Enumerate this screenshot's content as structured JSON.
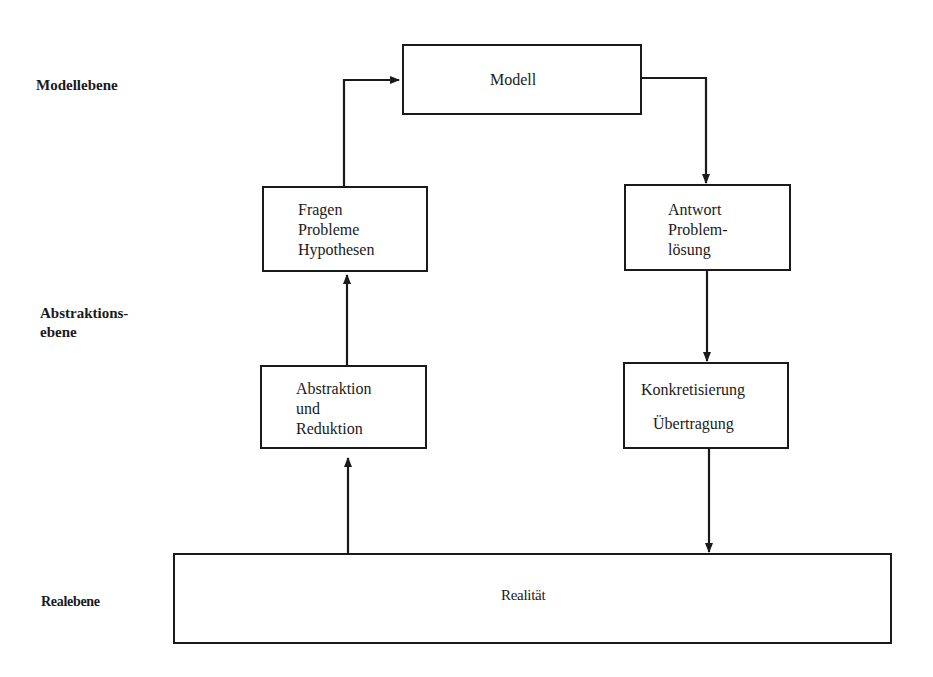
{
  "levels": {
    "model": "Modellebene",
    "abstraction_line1": "Abstraktions-",
    "abstraction_line2": "ebene",
    "real": "Realebene"
  },
  "boxes": {
    "modell": {
      "lines": [
        "Modell"
      ]
    },
    "fragen": {
      "lines": [
        "Fragen",
        "Probleme",
        "Hypothesen"
      ]
    },
    "antwort": {
      "lines": [
        "Antwort",
        "Problem-",
        "lösung"
      ]
    },
    "abstraktion": {
      "lines": [
        "Abstraktion",
        "und",
        "Reduktion"
      ]
    },
    "konkretisierung": {
      "lines": [
        "Konkretisierung",
        "Übertragung"
      ]
    },
    "realitaet": {
      "lines": [
        "Realität"
      ]
    }
  },
  "edges": [
    {
      "from": "realitaet",
      "to": "abstraktion"
    },
    {
      "from": "abstraktion",
      "to": "fragen"
    },
    {
      "from": "fragen",
      "to": "modell"
    },
    {
      "from": "modell",
      "to": "antwort"
    },
    {
      "from": "antwort",
      "to": "konkretisierung"
    },
    {
      "from": "konkretisierung",
      "to": "realitaet"
    }
  ],
  "colors": {
    "ink": "#1a1a1a",
    "background": "#ffffff"
  }
}
